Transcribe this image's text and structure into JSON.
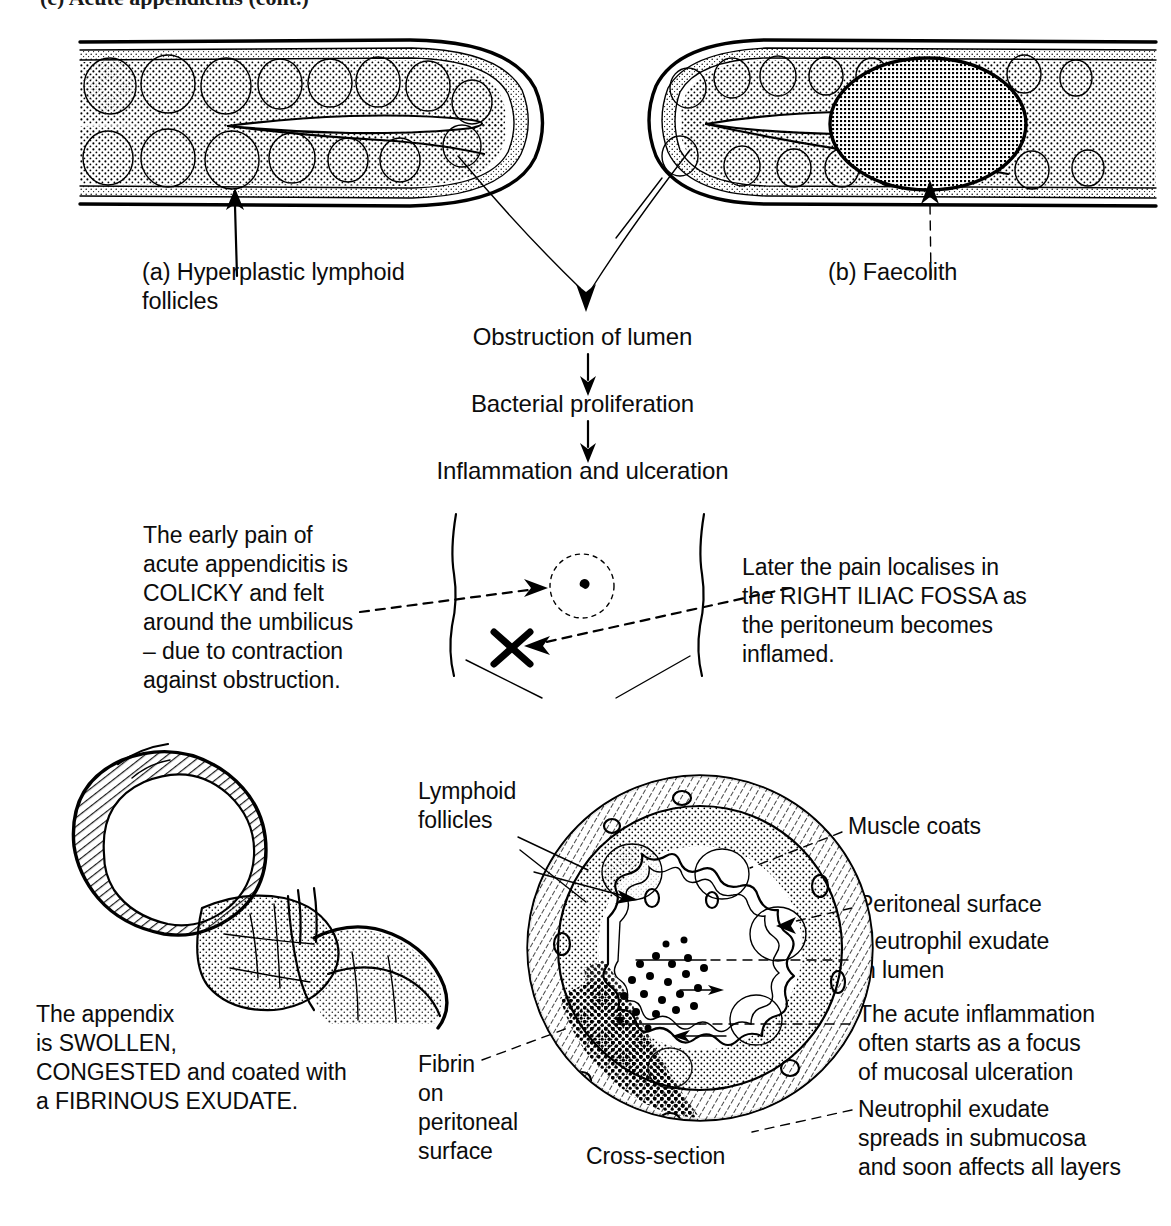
{
  "page": {
    "title_clipped": "(c) Acute appendicitis  (cont.)",
    "width": 1171,
    "height": 1226,
    "ink_color": "#000000",
    "background_color": "#ffffff"
  },
  "top_panel": {
    "caption_a": "(a) Hyperplastic lymphoid\n      follicles",
    "caption_b": "(b) Faecolith",
    "figure_a_name": "longitudinal-appendix-with-lymphoid-follicles",
    "figure_b_name": "longitudinal-appendix-with-faecolith"
  },
  "flow_chain": {
    "steps": [
      "Obstruction of lumen",
      "Bacterial proliferation",
      "Inflammation and ulceration"
    ]
  },
  "pain_panel": {
    "left_text": "The early pain of\nacute appendicitis is\nCOLICKY and felt\naround the umbilicus\n– due to contraction\nagainst obstruction.",
    "right_text": "Later the pain localises in\nthe RIGHT ILIAC FOSSA as\nthe peritoneum becomes\ninflamed.",
    "umbilicus_marker": "umbilicus-dotted-circle",
    "rif_marker": "X"
  },
  "bottom_panel": {
    "gross_text": "The appendix\nis SWOLLEN,\nCONGESTED and coated with\na FIBRINOUS EXUDATE.",
    "gross_figure_name": "swollen-appendix-and-caecum",
    "cross_section_label": "Cross-section",
    "labels": {
      "lymphoid_follicles": "Lymphoid\nfollicles",
      "muscle_coats": "Muscle coats",
      "peritoneal_surface": "Peritoneal surface",
      "neutrophil_exudate_lumen": "Neutrophil exudate\nin lumen",
      "acute_inflammation_focus": "The acute inflammation\noften starts as a focus\nof mucosal ulceration",
      "neutrophil_exudate_submucosa": "Neutrophil exudate\nspreads in submucosa\nand soon affects all layers",
      "fibrin_on_peritoneal_surface": "Fibrin\non\nperitoneal\nsurface"
    }
  }
}
